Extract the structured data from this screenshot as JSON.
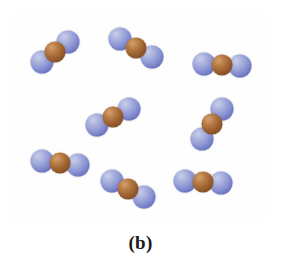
{
  "figure": {
    "caption": "(b)",
    "panel_label": "b",
    "width": 281,
    "height": 274,
    "background_color": "#ffffff",
    "box": {
      "border_color": "#3a3a3a",
      "border_width": 1.6,
      "fill_color": "#fefefe",
      "left": 11,
      "top": 12,
      "width": 257,
      "height": 210
    }
  },
  "legend": {
    "atom_types": [
      {
        "key": "blue",
        "label": "oxygen-atom",
        "color": "#8b95d4",
        "radius": 11.5
      },
      {
        "key": "brown",
        "label": "nitrogen-atom",
        "color": "#9e6331",
        "radius": 10.5
      }
    ],
    "molecule_formula": "NO2",
    "molecule_count": 9
  },
  "molecules": [
    {
      "id": 1,
      "name": "molecule-top-left",
      "center_x": 55,
      "center_y": 52,
      "angle_deg": -38,
      "bond_length": 17,
      "atoms": [
        "blue",
        "brown",
        "blue"
      ]
    },
    {
      "id": 2,
      "name": "molecule-top-center",
      "center_x": 136,
      "center_y": 48,
      "angle_deg": 30,
      "bond_length": 18,
      "atoms": [
        "blue",
        "brown",
        "blue"
      ]
    },
    {
      "id": 3,
      "name": "molecule-top-right",
      "center_x": 222,
      "center_y": 65,
      "angle_deg": 4,
      "bond_length": 18,
      "atoms": [
        "blue",
        "brown",
        "blue"
      ]
    },
    {
      "id": 4,
      "name": "molecule-middle-left",
      "center_x": 113,
      "center_y": 117,
      "angle_deg": -26,
      "bond_length": 18,
      "atoms": [
        "blue",
        "brown",
        "blue"
      ]
    },
    {
      "id": 5,
      "name": "molecule-middle-right",
      "center_x": 212,
      "center_y": 124,
      "angle_deg": -56,
      "bond_length": 18,
      "atoms": [
        "blue",
        "brown",
        "blue"
      ]
    },
    {
      "id": 6,
      "name": "molecule-bottom-left",
      "center_x": 60,
      "center_y": 163,
      "angle_deg": 6,
      "bond_length": 18,
      "atoms": [
        "blue",
        "brown",
        "blue"
      ]
    },
    {
      "id": 7,
      "name": "molecule-bottom-center",
      "center_x": 128,
      "center_y": 189,
      "angle_deg": 26,
      "bond_length": 18,
      "atoms": [
        "blue",
        "brown",
        "blue"
      ]
    },
    {
      "id": 8,
      "name": "molecule-bottom-right",
      "center_x": 203,
      "center_y": 182,
      "angle_deg": 2,
      "bond_length": 18,
      "atoms": [
        "blue",
        "brown",
        "blue"
      ]
    },
    {
      "id": 9,
      "name": "molecule-upper-right-partial",
      "center_x": 243,
      "center_y": 36,
      "angle_deg": 0,
      "bond_length": 0,
      "atoms": [],
      "hidden": true
    }
  ]
}
